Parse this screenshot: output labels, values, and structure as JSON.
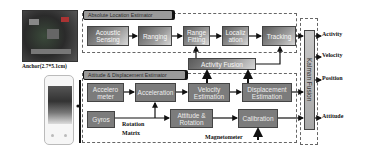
{
  "anchor": {
    "caption": "Anchor(2.7*5.1cm)"
  },
  "absolute_estimator": {
    "title": "Absolute Location Estimator",
    "blocks": [
      "Acoustic Sensing",
      "Ranging",
      "Range Fitting",
      "Localiz ation",
      "Tracking"
    ]
  },
  "activity_fusion": {
    "label": "Activity Fusion"
  },
  "attitude_estimator": {
    "title": "Attitude & Displacement Estimator",
    "blocks": {
      "accelerometer": "Accelero meter",
      "acceleration": "Acceleration",
      "velocity": "Velocity Estimation",
      "displacement": "Displacement Estimation",
      "gyros": "Gyros",
      "attitude_rotation": "Attitude & Rotation",
      "calibration": "Calibration"
    },
    "labels": {
      "rotation": "Rotation",
      "matrix": "Matrix",
      "magnetometer": "Magnetometer"
    }
  },
  "kalman": {
    "label": "Kalman Fusion"
  },
  "outputs": [
    "Activity",
    "Velocity",
    "Position",
    "Attitude"
  ]
}
